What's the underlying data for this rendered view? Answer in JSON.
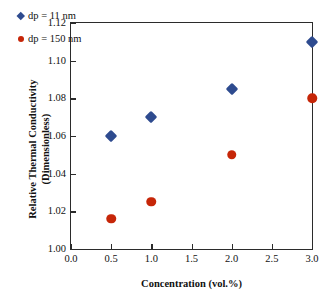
{
  "chart_data": {
    "type": "scatter",
    "title": "",
    "xlabel": "Concentration (vol.%)",
    "ylabel_line1": "Relative Thermal Conductivity",
    "ylabel_line2": "(Dimensionless)",
    "xlim": [
      0.0,
      3.0
    ],
    "ylim": [
      1.0,
      1.12
    ],
    "xticks": [
      "0.0",
      "0.5",
      "1.0",
      "1.5",
      "2.0",
      "2.5",
      "3.0"
    ],
    "xtick_values": [
      0.0,
      0.5,
      1.0,
      1.5,
      2.0,
      2.5,
      3.0
    ],
    "yticks": [
      "1.00",
      "1.02",
      "1.04",
      "1.06",
      "1.08",
      "1.10",
      "1.12"
    ],
    "ytick_values": [
      1.0,
      1.02,
      1.04,
      1.06,
      1.08,
      1.1,
      1.12
    ],
    "grid": false,
    "legend_position": "upper-left-inside",
    "series": [
      {
        "name": "dp = 11 nm",
        "marker": "diamond",
        "color": "#2E4B8F",
        "x": [
          0.5,
          1.0,
          2.0,
          3.0
        ],
        "values": [
          1.06,
          1.07,
          1.085,
          1.11
        ]
      },
      {
        "name": "dp = 150 nm",
        "marker": "circle",
        "color": "#C62608",
        "x": [
          0.5,
          1.0,
          2.0,
          3.0
        ],
        "values": [
          1.016,
          1.025,
          1.05,
          1.08
        ]
      }
    ]
  },
  "legend": {
    "entries": [
      {
        "label": "dp = 11 nm"
      },
      {
        "label": "dp = 150 nm"
      }
    ]
  },
  "colors": {
    "series_blue": "#2E4B8F",
    "series_red": "#C62608",
    "axis": "#2b2b2b",
    "background": "#ffffff"
  }
}
